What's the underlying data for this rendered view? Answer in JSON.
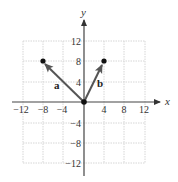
{
  "diagram": {
    "type": "vector-plot",
    "axes": {
      "x_label": "x",
      "y_label": "y",
      "range": [
        -12,
        12
      ],
      "tick_step": 4,
      "x_ticks": [
        "−12",
        "−8",
        "−4",
        "4",
        "8",
        "12"
      ],
      "y_ticks": [
        "12",
        "8",
        "4",
        "−4",
        "−8",
        "−12"
      ]
    },
    "vectors": [
      {
        "label": "a",
        "from": [
          0,
          0
        ],
        "to": [
          -8,
          8
        ]
      },
      {
        "label": "b",
        "from": [
          0,
          0
        ],
        "to": [
          4,
          8
        ]
      }
    ],
    "colors": {
      "grid": "#d0d0d0",
      "axis": "#444444",
      "vector": "#555555",
      "point": "#111111"
    }
  }
}
